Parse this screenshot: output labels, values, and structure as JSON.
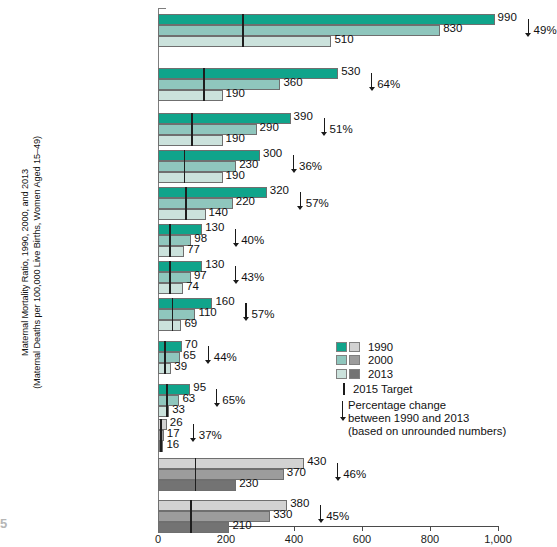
{
  "chart_data": {
    "type": "bar",
    "orientation": "horizontal",
    "title": "",
    "ylabel": "Maternal Mortality Ratio, 1990, 2000, and 2013\n(Maternal Deaths per 100,000 Live Births, Women Aged 15–49)",
    "xlabel": "",
    "xlim": [
      0,
      1000
    ],
    "xticks": [
      0,
      200,
      400,
      600,
      800,
      1000
    ],
    "xticklabels": [
      "0",
      "200",
      "400",
      "600",
      "800",
      "1,000"
    ],
    "grid": false,
    "legend_position": "right-middle",
    "categories": [
      "Sub-Saharan Africa",
      "Southern Asia",
      "Oceania",
      "Caribbean",
      "South-Eastern Asia",
      "Latin America",
      "Western Asia",
      "Northern Africa",
      "Caucasus and Central Asia",
      "Eastern Asia",
      "Developed Regions",
      "Developing Regions",
      "World"
    ],
    "series": [
      {
        "name": "1990",
        "values": [
          990,
          530,
          390,
          300,
          320,
          130,
          130,
          160,
          70,
          95,
          26,
          430,
          380
        ]
      },
      {
        "name": "2000",
        "values": [
          830,
          360,
          290,
          230,
          220,
          98,
          97,
          110,
          65,
          63,
          17,
          370,
          330
        ]
      },
      {
        "name": "2013",
        "values": [
          510,
          190,
          190,
          190,
          140,
          77,
          74,
          69,
          39,
          33,
          16,
          230,
          210
        ]
      }
    ],
    "percentage_change": [
      "49%",
      "64%",
      "51%",
      "36%",
      "57%",
      "40%",
      "43%",
      "57%",
      "44%",
      "65%",
      "37%",
      "46%",
      "45%"
    ],
    "target_2015": [
      248,
      133,
      98,
      75,
      80,
      33,
      33,
      40,
      18,
      24,
      7,
      108,
      95
    ],
    "palette_group": [
      "teal",
      "teal",
      "teal",
      "teal",
      "teal",
      "teal",
      "teal",
      "teal",
      "teal",
      "teal",
      "gray",
      "gray",
      "gray"
    ],
    "annotations": {
      "target_note": "2015 Target",
      "pct_note_line1": "Percentage change",
      "pct_note_line2": "between 1990 and 2013",
      "pct_note_line3": "(based on unrounded numbers)"
    }
  },
  "colors": {
    "teal_1990": "#10a48b",
    "teal_2000": "#8fc6bd",
    "teal_2013": "#cbe2dc",
    "gray_1990": "#d2d2d2",
    "gray_2000": "#9c9c9c",
    "gray_2013": "#737373",
    "bar_border": "#6f6f6f",
    "axis": "#4a4a4a",
    "text": "#111111",
    "corner_accent": "#7fc9bd"
  },
  "legend": {
    "items": [
      {
        "label": "1990",
        "teal": "#10a48b",
        "gray": "#d2d2d2"
      },
      {
        "label": "2000",
        "teal": "#8fc6bd",
        "gray": "#9c9c9c"
      },
      {
        "label": "2013",
        "teal": "#cbe2dc",
        "gray": "#737373"
      }
    ],
    "target_label": "2015 Target",
    "pct_label_1": "Percentage change",
    "pct_label_2": "between 1990 and 2013",
    "pct_label_3": "(based on unrounded numbers)"
  },
  "corner_caption": {
    "line1": "5",
    "line2": "y Rates",
    "line3": "f"
  }
}
